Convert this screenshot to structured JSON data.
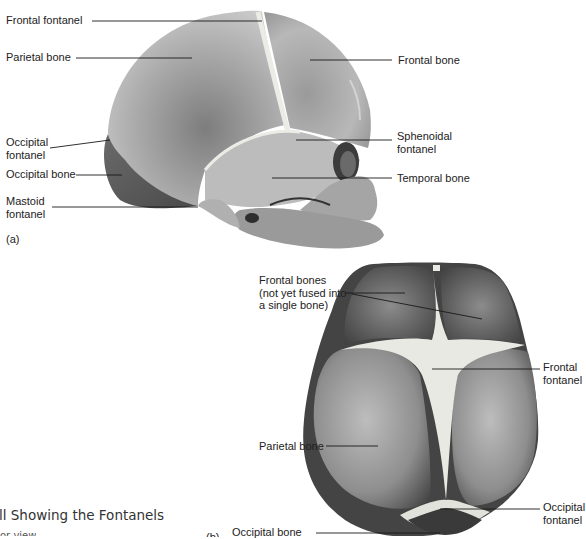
{
  "figure": {
    "caption_fragment": "ll Showing the Fontanels",
    "subcaption_fragment": "or view",
    "panel_a_label": "(a)",
    "panel_b_label": "(b)"
  },
  "panel_a": {
    "view": "lateral skull",
    "labels": [
      {
        "id": "frontal-fontanel",
        "text": "Frontal fontanel",
        "x": 6,
        "y": 14
      },
      {
        "id": "parietal-bone",
        "text": "Parietal bone",
        "x": 6,
        "y": 51
      },
      {
        "id": "frontal-bone",
        "text": "Frontal bone",
        "x": 398,
        "y": 55
      },
      {
        "id": "occipital-fontanel",
        "text": "Occipital\nfontanel",
        "x": 6,
        "y": 136
      },
      {
        "id": "sphenoidal-fontanel",
        "text": "Sphenoidal\nfontanel",
        "x": 397,
        "y": 130
      },
      {
        "id": "occipital-bone",
        "text": "Occipital bone",
        "x": 6,
        "y": 168
      },
      {
        "id": "temporal-bone",
        "text": "Temporal bone",
        "x": 397,
        "y": 173
      },
      {
        "id": "mastoid-fontanel",
        "text": "Mastoid\nfontanel",
        "x": 6,
        "y": 195
      }
    ]
  },
  "panel_b": {
    "view": "superior skull",
    "labels": [
      {
        "id": "frontal-bones",
        "text": "Frontal bones\n(not yet fused into\na single bone)",
        "x": 259,
        "y": 274
      },
      {
        "id": "frontal-fontanel",
        "text": "Frontal\nfontanel",
        "x": 543,
        "y": 361
      },
      {
        "id": "parietal-bone",
        "text": "Parietal bone",
        "x": 259,
        "y": 440
      },
      {
        "id": "occipital-fontanel",
        "text": "Occipital\nfontanel",
        "x": 543,
        "y": 501
      },
      {
        "id": "occipital-bone",
        "text": "Occipital bone",
        "x": 232,
        "y": 526
      }
    ]
  },
  "colors": {
    "background": "#ffffff",
    "text": "#222222",
    "leader_line": "#1a1a1a",
    "bone_light": "#c8c8c8",
    "bone_mid": "#9a9a9a",
    "bone_dark": "#555555",
    "fontanel": "#e8e8e2"
  }
}
